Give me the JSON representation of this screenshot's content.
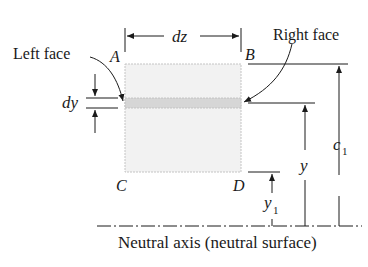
{
  "figure": {
    "labels": {
      "left_face": "Left face",
      "right_face": "Right face",
      "dz": "dz",
      "dy": "dy",
      "A": "A",
      "B": "B",
      "C": "C",
      "D": "D",
      "y": "y",
      "y1_base": "y",
      "y1_sub": "1",
      "c1_base": "c",
      "c1_sub": "1",
      "neutral_axis": "Neutral axis (neutral surface)"
    },
    "colors": {
      "element_fill": "#f2f2f2",
      "element_border": "#bdbdbd",
      "strip_fill": "#d9d9d9",
      "line": "#1a1a1a"
    }
  }
}
